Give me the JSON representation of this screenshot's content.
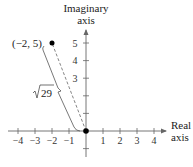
{
  "diagram": {
    "type": "complex-plane-plot",
    "axes": {
      "x_label_line1": "Real",
      "x_label_line2": "axis",
      "y_label_line1": "Imaginary",
      "y_label_line2": "axis",
      "x_range": [
        -4,
        4
      ],
      "y_range": [
        -1,
        5
      ]
    },
    "x_ticks": [
      {
        "value": -4,
        "label": "−4"
      },
      {
        "value": -3,
        "label": "−3"
      },
      {
        "value": -2,
        "label": "−2"
      },
      {
        "value": -1,
        "label": "−1"
      },
      {
        "value": 1,
        "label": "1"
      },
      {
        "value": 2,
        "label": "2"
      },
      {
        "value": 3,
        "label": "3"
      },
      {
        "value": 4,
        "label": "4"
      }
    ],
    "y_ticks": [
      {
        "value": 1,
        "label": ""
      },
      {
        "value": 2,
        "label": ""
      },
      {
        "value": 3,
        "label": "3"
      },
      {
        "value": 4,
        "label": "4"
      },
      {
        "value": 5,
        "label": "5"
      },
      {
        "value": -1,
        "label": ""
      }
    ],
    "points": [
      {
        "x": -2,
        "y": 5,
        "label": "(−2, 5)"
      },
      {
        "x": 0,
        "y": 0,
        "label": ""
      }
    ],
    "segment": {
      "from": [
        0,
        0
      ],
      "to": [
        -2,
        5
      ],
      "style": "dashed"
    },
    "distance_label": "29",
    "distance_radical": "√",
    "colors": {
      "axis": "#666666",
      "point": "#000000",
      "dashed": "#777777"
    }
  }
}
